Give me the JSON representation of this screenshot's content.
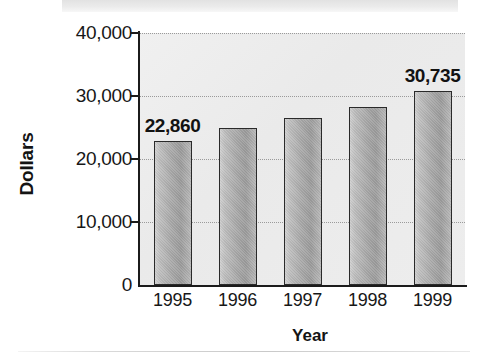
{
  "chart_data": {
    "type": "bar",
    "title": "",
    "xlabel": "Year",
    "ylabel": "Dollars",
    "categories": [
      "1995",
      "1996",
      "1997",
      "1998",
      "1999"
    ],
    "values": [
      22860,
      24900,
      26500,
      28300,
      30735
    ],
    "point_labels": [
      "22,860",
      "",
      "",
      "",
      "30,735"
    ],
    "ylim": [
      0,
      40000
    ],
    "ytick_values": [
      0,
      10000,
      20000,
      30000,
      40000
    ],
    "ytick_labels": [
      "0",
      "10,000",
      "20,000",
      "30,000",
      "40,000"
    ],
    "grid": true,
    "grid_style": "dotted-horizontal",
    "legend": "none",
    "bar_fill": "#a8a8a8",
    "bar_outline": "#2a2a2a",
    "plot_background": "#ededed",
    "axis_color": "#1b1b1b",
    "text_color": "#141414"
  }
}
